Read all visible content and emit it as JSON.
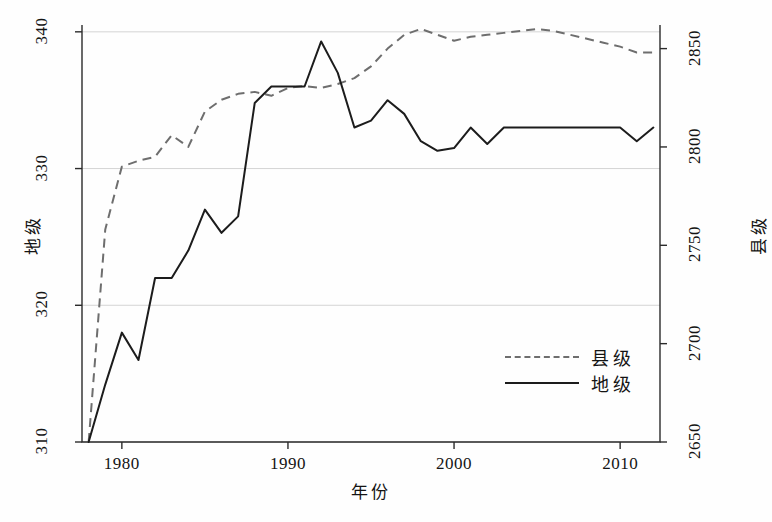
{
  "chart_data": {
    "type": "line",
    "title": "",
    "xlabel": "年份",
    "ylabel": "地级",
    "ylabel_right": "县级",
    "xlim": [
      1977.6,
      2012.4
    ],
    "ylim": [
      310,
      340.5
    ],
    "ylim_right": [
      2650,
      2862
    ],
    "xticks": [
      1980,
      1990,
      2000,
      2010
    ],
    "yticks_left": [
      310,
      320,
      330,
      340
    ],
    "yticks_right": [
      2650,
      2700,
      2750,
      2800,
      2850
    ],
    "grid": "horizontal",
    "legend_position": "inside-lower-right",
    "x": [
      1978,
      1979,
      1980,
      1981,
      1982,
      1983,
      1984,
      1985,
      1986,
      1987,
      1988,
      1989,
      1990,
      1991,
      1992,
      1993,
      1994,
      1995,
      1996,
      1997,
      1998,
      1999,
      2000,
      2001,
      2002,
      2003,
      2004,
      2005,
      2006,
      2007,
      2008,
      2009,
      2010,
      2011,
      2012
    ],
    "series": [
      {
        "name": "县级",
        "axis": "right",
        "style": "dashed",
        "color": "#6e6e6e",
        "values": [
          2650,
          2758,
          2790,
          2793,
          2795,
          2806,
          2800,
          2818,
          2824,
          2827,
          2828,
          2826,
          2830,
          2831,
          2830,
          2832,
          2835,
          2841,
          2850,
          2857,
          2860,
          2857,
          2854,
          2856,
          2857,
          2858,
          2859,
          2860,
          2859,
          2857,
          2855,
          2853,
          2851,
          2848,
          2848
        ]
      },
      {
        "name": "地级",
        "axis": "left",
        "style": "solid",
        "color": "#1c1c1c",
        "values": [
          310,
          314.2,
          318,
          316,
          322,
          322,
          324,
          327,
          325.3,
          326.5,
          334.8,
          336,
          336,
          336,
          339.3,
          337,
          333,
          333.5,
          335,
          334,
          332,
          331.3,
          331.5,
          333,
          331.8,
          333,
          333,
          333,
          333,
          333,
          333,
          333,
          333,
          332,
          333
        ]
      }
    ],
    "legend": [
      {
        "label": "县级",
        "style": "dashed"
      },
      {
        "label": "地级",
        "style": "solid"
      }
    ],
    "caption": ""
  },
  "axis": {
    "xlabel": "年份",
    "ylabel_left": "地级",
    "ylabel_right": "县级",
    "xtick_labels": [
      "1980",
      "1990",
      "2000",
      "2010"
    ],
    "ytick_left_labels": [
      "310",
      "320",
      "330",
      "340"
    ],
    "ytick_right_labels": [
      "2650",
      "2700",
      "2750",
      "2800",
      "2850"
    ]
  },
  "legend": {
    "county_label": "县级",
    "prefecture_label": "地级"
  },
  "caption": {
    "text": ""
  }
}
